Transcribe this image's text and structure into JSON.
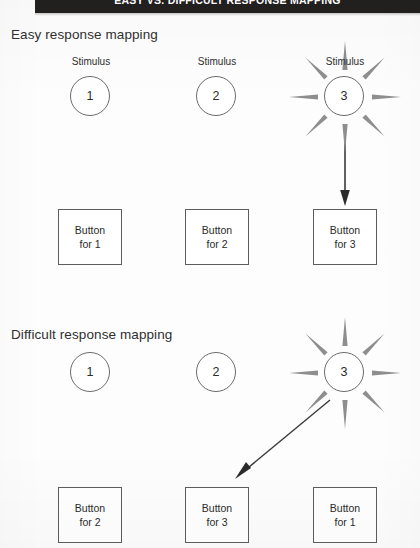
{
  "page": {
    "title": "EASY VS. DIFFICULT RESPONSE MAPPING",
    "background_color": "#fdfdfd",
    "banner_color": "#221f1f",
    "line_color": "#5d5d5d",
    "text_color": "#2b2b2b"
  },
  "sections": [
    {
      "id": "easy",
      "heading": "Easy response mapping",
      "stimuli": [
        {
          "label": "Stimulus",
          "value": "1",
          "show_label": true,
          "highlighted": false
        },
        {
          "label": "Stimulus",
          "value": "2",
          "show_label": true,
          "highlighted": false
        },
        {
          "label": "Stimulus",
          "value": "3",
          "show_label": true,
          "highlighted": true
        }
      ],
      "buttons": [
        {
          "line1": "Button",
          "line2": "for 1"
        },
        {
          "line1": "Button",
          "line2": "for 2"
        },
        {
          "line1": "Button",
          "line2": "for 3"
        }
      ],
      "mapping_arrow": {
        "from_stimulus": "3",
        "to_button": "Button for 3",
        "style": "vertical"
      }
    },
    {
      "id": "difficult",
      "heading": "Difficult response mapping",
      "stimuli": [
        {
          "label": "Stimulus",
          "value": "1",
          "show_label": false,
          "highlighted": false
        },
        {
          "label": "Stimulus",
          "value": "2",
          "show_label": false,
          "highlighted": false
        },
        {
          "label": "Stimulus",
          "value": "3",
          "show_label": false,
          "highlighted": true
        }
      ],
      "buttons": [
        {
          "line1": "Button",
          "line2": "for 2"
        },
        {
          "line1": "Button",
          "line2": "for 3"
        },
        {
          "line1": "Button",
          "line2": "for 1"
        }
      ],
      "mapping_arrow": {
        "from_stimulus": "3",
        "to_button": "Button for 3",
        "style": "diagonal"
      }
    }
  ]
}
